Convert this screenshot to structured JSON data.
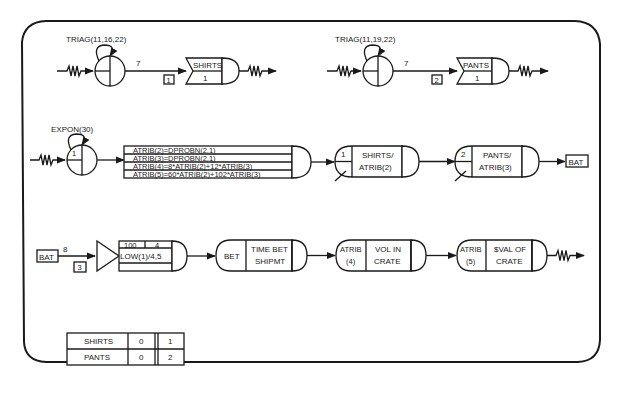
{
  "diagram": {
    "row1": {
      "shirts_create": {
        "distribution": "TRIAG(11,16,22)",
        "activity_attr": "7",
        "activity_number": "1",
        "queue_label": "SHIRTS",
        "queue_init": "1"
      },
      "pants_create": {
        "distribution": "TRIAG(11,19,22)",
        "activity_attr": "7",
        "activity_number": "2",
        "queue_label": "PANTS",
        "queue_init": "1"
      }
    },
    "row2": {
      "expon_create": {
        "distribution": "EXPON(30)",
        "count": "1"
      },
      "assign_lines": [
        "ATRIB(2)=DPROBN(2,1)",
        "ATRIB(3)=DPROBN(2,1)",
        "ATRIB(4)=8*ATRIB(2)+12*ATRIB(3)",
        "ATRIB(5)=60*ATRIB(2)+102*ATRIB(3)"
      ],
      "select_shirts": {
        "file": "1",
        "label_line1": "SHIRTS/",
        "label_line2": "ATRIB(2)"
      },
      "select_pants": {
        "file": "2",
        "label_line1": "PANTS/",
        "label_line2": "ATRIB(3)"
      },
      "goto_label": "BAT"
    },
    "row3": {
      "start_label": "BAT",
      "activity_attr": "8",
      "activity_number": "3",
      "batch": {
        "top_left": "100",
        "top_right": "4",
        "middle": "LOW(1)/4,5",
        "bottom": ""
      },
      "collect_bet": {
        "left": "BET",
        "line1": "TIME BET",
        "line2": "SHIPMT"
      },
      "collect_vol": {
        "left_line1": "ATRIB",
        "left_line2": "(4)",
        "line1": "VOL IN",
        "line2": "CRATE"
      },
      "collect_val": {
        "left_line1": "ATRIB",
        "left_line2": "(5)",
        "line1": "$VAL OF",
        "line2": "CRATE"
      }
    },
    "resource_table": {
      "rows": [
        {
          "name": "SHIRTS",
          "initial": "0",
          "file": "1"
        },
        {
          "name": "PANTS",
          "initial": "0",
          "file": "2"
        }
      ]
    }
  }
}
